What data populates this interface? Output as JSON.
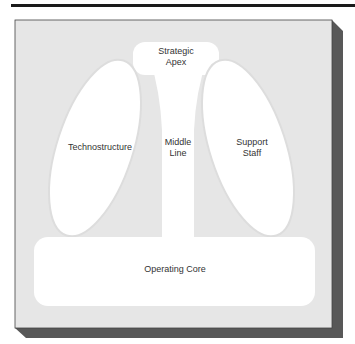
{
  "diagram": {
    "type": "organizational-structure",
    "parts": {
      "strategic_apex": "Strategic\nApex",
      "technostructure": "Technostructure",
      "middle_line": "Middle\nLine",
      "support_staff": "Support\nStaff",
      "operating_core": "Operating Core"
    }
  },
  "colors": {
    "background_panel": "#e6e6e6",
    "shape_fill": "#ffffff",
    "shadow": "#555555",
    "top_rule": "#1a1a1a"
  }
}
